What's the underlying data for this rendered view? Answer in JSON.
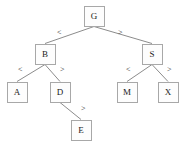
{
  "diagram": {
    "type": "binary-search-tree",
    "canvas": {
      "width": 188,
      "height": 151
    },
    "colors": {
      "background": "#ffffff",
      "node_fill": "#fdfdfd",
      "node_border": "#a8a8a8",
      "edge": "#8c8c8c",
      "text": "#1a1a1a"
    },
    "node_size": {
      "width": 21,
      "height": 21
    },
    "nodes": [
      {
        "id": "G",
        "label": "G",
        "cx": 94,
        "cy": 16,
        "level": 0
      },
      {
        "id": "B",
        "label": "B",
        "cx": 45,
        "cy": 54,
        "level": 1
      },
      {
        "id": "S",
        "label": "S",
        "cx": 152,
        "cy": 54,
        "level": 1
      },
      {
        "id": "A",
        "label": "A",
        "cx": 17,
        "cy": 92,
        "level": 2
      },
      {
        "id": "D",
        "label": "D",
        "cx": 60,
        "cy": 92,
        "level": 2
      },
      {
        "id": "M",
        "label": "M",
        "cx": 127,
        "cy": 92,
        "level": 2
      },
      {
        "id": "X",
        "label": "X",
        "cx": 168,
        "cy": 92,
        "level": 2
      },
      {
        "id": "E",
        "label": "E",
        "cx": 81,
        "cy": 130,
        "level": 3
      }
    ],
    "edges": [
      {
        "id": "G-B",
        "from": "G",
        "to": "B",
        "label": "<",
        "label_x": 57,
        "label_y": 29
      },
      {
        "id": "G-S",
        "from": "G",
        "to": "S",
        "label": ">",
        "label_x": 118,
        "label_y": 29
      },
      {
        "id": "B-A",
        "from": "B",
        "to": "A",
        "label": "<",
        "label_x": 18,
        "label_y": 66
      },
      {
        "id": "B-D",
        "from": "B",
        "to": "D",
        "label": ">",
        "label_x": 60,
        "label_y": 66
      },
      {
        "id": "S-M",
        "from": "S",
        "to": "M",
        "label": "<",
        "label_x": 126,
        "label_y": 66
      },
      {
        "id": "S-X",
        "from": "S",
        "to": "X",
        "label": ">",
        "label_x": 167,
        "label_y": 66
      },
      {
        "id": "D-E",
        "from": "D",
        "to": "E",
        "label": ">",
        "label_x": 81,
        "label_y": 105
      }
    ]
  }
}
